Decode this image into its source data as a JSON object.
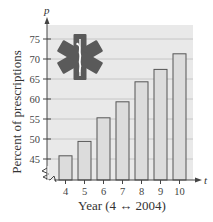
{
  "chart_data": {
    "type": "bar",
    "title": "",
    "xlabel": "Year (4 ↔ 2004)",
    "ylabel": "Percent of prescriptions",
    "x_var": "t",
    "y_var": "p",
    "categories": [
      "4",
      "5",
      "6",
      "7",
      "8",
      "9",
      "10"
    ],
    "values": [
      45.8,
      49.4,
      55.3,
      59.3,
      64.3,
      67.4,
      71.3
    ],
    "yticks": [
      45,
      50,
      55,
      60,
      65,
      70,
      75
    ],
    "ylim": [
      45,
      77
    ],
    "y_axis_break": true,
    "grid": true,
    "legend": null,
    "annotation_icon": "star-of-life-icon"
  },
  "colors": {
    "plot_bg": "#e9e9e9",
    "bar_fill": "#dcdcdc",
    "bar_stroke": "#555555",
    "grid": "#bdbdbd",
    "icon": "#5a5a5a"
  }
}
